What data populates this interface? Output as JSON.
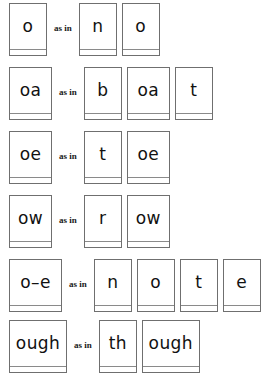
{
  "worksheet": {
    "title": "Long o grapheme cards",
    "connective": "as in",
    "rows": [
      {
        "id": "row-o",
        "grapheme": "o",
        "grapheme_width": "w-38",
        "word": "no",
        "word_cards": [
          {
            "text": "n",
            "width": "w-38"
          },
          {
            "text": "o",
            "width": "w-38"
          }
        ]
      },
      {
        "id": "row-oa",
        "grapheme": "oa",
        "grapheme_width": "w-43",
        "word": "boat",
        "word_cards": [
          {
            "text": "b",
            "width": "w-38"
          },
          {
            "text": "oa",
            "width": "w-43"
          },
          {
            "text": "t",
            "width": "w-38"
          }
        ]
      },
      {
        "id": "row-oe",
        "grapheme": "oe",
        "grapheme_width": "w-43",
        "word": "toe",
        "word_cards": [
          {
            "text": "t",
            "width": "w-38"
          },
          {
            "text": "oe",
            "width": "w-43"
          }
        ]
      },
      {
        "id": "row-ow",
        "grapheme": "ow",
        "grapheme_width": "w-43",
        "word": "row",
        "word_cards": [
          {
            "text": "r",
            "width": "w-38"
          },
          {
            "text": "ow",
            "width": "w-43"
          }
        ]
      },
      {
        "id": "row-o-e",
        "grapheme": "o–e",
        "grapheme_width": "w-53",
        "word": "note",
        "word_cards": [
          {
            "text": "n",
            "width": "w-38"
          },
          {
            "text": "o",
            "width": "w-38"
          },
          {
            "text": "t",
            "width": "w-38"
          },
          {
            "text": "e",
            "width": "w-38"
          }
        ]
      },
      {
        "id": "row-ough",
        "grapheme": "ough",
        "grapheme_width": "w-58",
        "word": "though",
        "word_cards": [
          {
            "text": "th",
            "width": "w-38"
          },
          {
            "text": "ough",
            "width": "w-58"
          }
        ]
      }
    ]
  },
  "colors": {
    "card_border": "#6f6f6f",
    "card_rule": "#8a8a8a",
    "text": "#111111",
    "background": "#ffffff"
  }
}
